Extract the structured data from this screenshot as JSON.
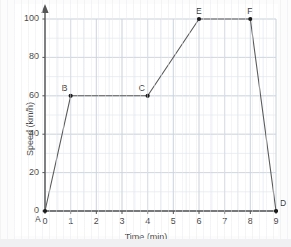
{
  "chart_data": {
    "type": "line",
    "title": "",
    "xlabel": "Time (min)",
    "ylabel": "Speed (km/h)",
    "xlim": [
      0,
      9
    ],
    "ylim": [
      0,
      100
    ],
    "xticks": [
      0,
      1,
      2,
      3,
      4,
      5,
      6,
      7,
      8,
      9
    ],
    "xtick_labels": [
      "0",
      "1",
      "2",
      "3",
      "4",
      "5",
      "6",
      "7",
      "8",
      "9"
    ],
    "yticks": [
      0,
      20,
      40,
      60,
      80,
      100
    ],
    "ytick_labels": [
      "0",
      "20",
      "40",
      "60",
      "80",
      "100"
    ],
    "grid": true,
    "grid_minor_x_step": 0.5,
    "grid_minor_y_step": 10,
    "legend": false,
    "axis_arrows": true,
    "series": [
      {
        "name": "Speed profile",
        "x": [
          0,
          1,
          4,
          6,
          8,
          9
        ],
        "y": [
          0,
          60,
          60,
          100,
          100,
          0
        ],
        "point_labels": [
          "A",
          "B",
          "C",
          "E",
          "F",
          "D"
        ],
        "marker": "filled-circle"
      }
    ],
    "points": [
      {
        "label": "A",
        "x": 0,
        "y": 0,
        "label_pos": "below-left"
      },
      {
        "label": "B",
        "x": 1,
        "y": 60,
        "label_pos": "above-left"
      },
      {
        "label": "C",
        "x": 4,
        "y": 60,
        "label_pos": "above-left"
      },
      {
        "label": "E",
        "x": 6,
        "y": 100,
        "label_pos": "above"
      },
      {
        "label": "F",
        "x": 8,
        "y": 100,
        "label_pos": "above"
      },
      {
        "label": "D",
        "x": 9,
        "y": 0,
        "label_pos": "above-right"
      }
    ],
    "colors": {
      "background": "#fcfcfc",
      "plot_background": "#ffffff",
      "grid_major": "#c9d2dc",
      "grid_minor": "#e2e8ee",
      "axis": "#555555",
      "line": "#5a5a5a",
      "marker": "#1a1a1a",
      "text": "#4a4a4a"
    }
  }
}
